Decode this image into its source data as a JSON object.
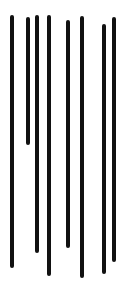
{
  "image": {
    "width": 126,
    "height": 281,
    "background": "#ffffff",
    "stroke_color": "#111111",
    "stroke_width": 4
  },
  "strokes": [
    {
      "x": 12,
      "top": 15,
      "bottom": 268
    },
    {
      "x": 28,
      "top": 17,
      "bottom": 145
    },
    {
      "x": 37,
      "top": 15,
      "bottom": 253
    },
    {
      "x": 49,
      "top": 15,
      "bottom": 276
    },
    {
      "x": 68,
      "top": 20,
      "bottom": 248
    },
    {
      "x": 82,
      "top": 16,
      "bottom": 278
    },
    {
      "x": 104,
      "top": 24,
      "bottom": 274
    },
    {
      "x": 114,
      "top": 17,
      "bottom": 262
    }
  ]
}
